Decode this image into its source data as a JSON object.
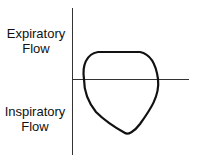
{
  "diagram": {
    "title": "",
    "y_axis_labels": {
      "upper_line1": "Expiratory",
      "upper_line2": "Flow",
      "lower_line1": "Inspiratory",
      "lower_line2": "Flow"
    },
    "colors": {
      "line": "#111111",
      "axis": "#333333",
      "background": "#ffffff"
    }
  }
}
